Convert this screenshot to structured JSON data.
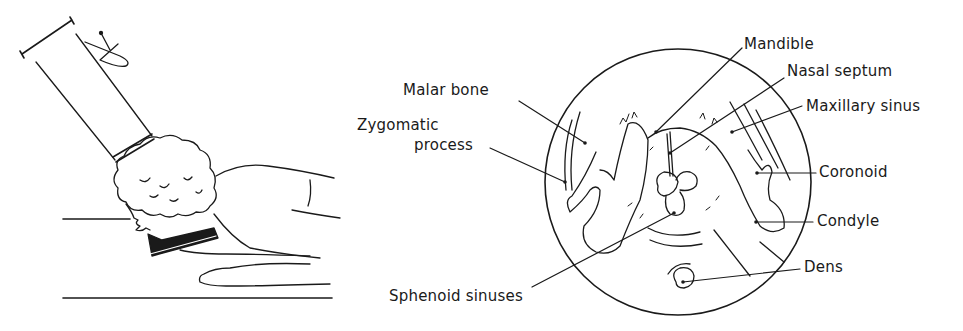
{
  "figure": {
    "left_panel": {
      "description": "Patient prone with chin on angled support; x-ray tube angled over head"
    },
    "right_panel": {
      "description": "Circular radiograph diagram of skull base view",
      "labels": {
        "mandible": "Mandible",
        "nasal_septum": "Nasal septum",
        "maxillary_sinus": "Maxillary sinus",
        "malar_bone": "Malar bone",
        "zygomatic_process_line1": "Zygomatic",
        "zygomatic_process_line2": "process",
        "coronoid": "Coronoid",
        "condyle": "Condyle",
        "dens": "Dens",
        "sphenoid_sinuses": "Sphenoid sinuses"
      }
    },
    "colors": {
      "ink": "#1a1a1a",
      "background": "#ffffff"
    }
  }
}
